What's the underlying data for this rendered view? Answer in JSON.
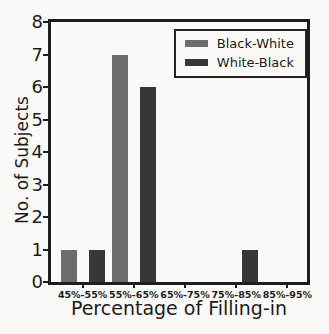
{
  "figure": {
    "background": "#fbfaf8",
    "axis_color": "#1e1e1e",
    "text_color": "#1b1b1b"
  },
  "chart_data": {
    "type": "bar",
    "xlabel": "Percentage of Filling-in",
    "ylabel": "No. of Subjects",
    "categories": [
      "45%-55%",
      "55%-65%",
      "65%-75%",
      "75%-85%",
      "85%-95%"
    ],
    "series": [
      {
        "name": "Black-White",
        "color": "#6d6d6d",
        "values": [
          1,
          7,
          0,
          0,
          0
        ]
      },
      {
        "name": "White-Black",
        "color": "#373737",
        "values": [
          1,
          6,
          0,
          1,
          0
        ]
      }
    ],
    "ylim": [
      0,
      8
    ],
    "yticks": [
      0,
      1,
      2,
      3,
      4,
      5,
      6,
      7,
      8
    ],
    "grid": false,
    "legend_position": "upper right"
  }
}
